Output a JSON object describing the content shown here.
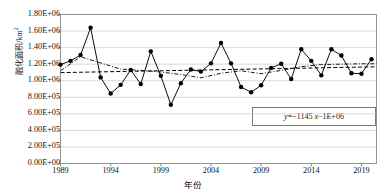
{
  "chart_data": {
    "type": "line",
    "title": "",
    "xlabel": "年份",
    "ylabel": "融化面积/km²",
    "ylabel_base": "融化面积/km",
    "ylabel_sup": "2",
    "xlim": [
      1989,
      2020.5
    ],
    "ylim": [
      0,
      1800000
    ],
    "grid": true,
    "grid_axis": "y",
    "legend": "none",
    "ytick_labels": [
      "0.00E+00",
      "2.00E+05",
      "4.00E+05",
      "6.00E+05",
      "8.00E+05",
      "1.00E+06",
      "1.20E+06",
      "1.40E+06",
      "1.60E+06",
      "1.80E+06"
    ],
    "ytick_values": [
      0,
      200000,
      400000,
      600000,
      800000,
      1000000,
      1200000,
      1400000,
      1600000,
      1800000
    ],
    "xtick_labels": [
      "1989",
      "1994",
      "1999",
      "2004",
      "2009",
      "2014",
      "2019"
    ],
    "xtick_values": [
      1989,
      1994,
      1999,
      2004,
      2009,
      2014,
      2019
    ],
    "annotations": [
      {
        "name": "trend-equation",
        "text": "y=−1145 x−1E+06",
        "text_y": "y",
        "text_rest": "=−1145 ",
        "text_x": "x",
        "text_tail": "−1E+06"
      }
    ],
    "series": [
      {
        "name": "融化面积",
        "style": "solid-line-with-markers",
        "color": "#000000",
        "marker": "circle",
        "x": [
          1989,
          1990,
          1991,
          1992,
          1993,
          1994,
          1995,
          1996,
          1997,
          1998,
          1999,
          2000,
          2001,
          2002,
          2003,
          2004,
          2005,
          2006,
          2007,
          2008,
          2009,
          2010,
          2011,
          2012,
          2013,
          2014,
          2015,
          2016,
          2017,
          2018,
          2019,
          2020
        ],
        "values": [
          1195000,
          1240000,
          1310000,
          1640000,
          1040000,
          845000,
          950000,
          1130000,
          960000,
          1355000,
          1060000,
          710000,
          970000,
          1135000,
          1110000,
          1210000,
          1455000,
          1210000,
          925000,
          860000,
          945000,
          1155000,
          1205000,
          1020000,
          1380000,
          1240000,
          1065000,
          1380000,
          1305000,
          1090000,
          1085000,
          1260000
        ]
      },
      {
        "name": "线性趋势线",
        "style": "dashed-line",
        "color": "#000000",
        "x": [
          1989,
          2020.5
        ],
        "values": [
          1098000,
          1168000
        ]
      },
      {
        "name": "多项式趋势线",
        "style": "dash-dot-line",
        "color": "#000000",
        "x": [
          1989,
          1991,
          1993,
          1995,
          1997,
          1999,
          2001,
          2003,
          2005,
          2007,
          2009,
          2011,
          2013,
          2015,
          2017,
          2019,
          2020.5
        ],
        "values": [
          1120000,
          1290000,
          1215000,
          1140000,
          1125000,
          1105000,
          1075000,
          1035000,
          1090000,
          1120000,
          1085000,
          1125000,
          1170000,
          1195000,
          1200000,
          1205000,
          1205000
        ]
      }
    ]
  }
}
